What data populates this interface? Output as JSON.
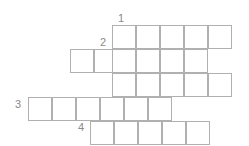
{
  "puzzle": {
    "type": "crossword-grid",
    "canvas": {
      "width": 249,
      "height": 146
    },
    "cell_size": 24,
    "colors": {
      "cell_border": "#b0b0b0",
      "cell_fill": "#ffffff",
      "clue_number": "#8a8a8a",
      "background": "#ffffff"
    },
    "clue_numbers": [
      {
        "label": "1",
        "x": 118,
        "y": 13
      },
      {
        "label": "2",
        "x": 100,
        "y": 37
      },
      {
        "label": "3",
        "x": 15,
        "y": 99
      },
      {
        "label": "4",
        "x": 78,
        "y": 122
      }
    ],
    "rows": [
      {
        "name": "row-1",
        "y": 25,
        "x_start": 112,
        "count": 5
      },
      {
        "name": "row-2",
        "y": 49,
        "x_start": 70,
        "count": 5
      },
      {
        "name": "row-3",
        "y": 73,
        "x_start": 112,
        "count": 5
      },
      {
        "name": "row-4",
        "y": 97,
        "x_start": 28,
        "count": 6
      },
      {
        "name": "row-5",
        "y": 121,
        "x_start": 90,
        "count": 5
      }
    ],
    "cells": [
      {
        "row": 1,
        "col": 1,
        "x": 112,
        "y": 25
      },
      {
        "row": 1,
        "col": 2,
        "x": 136,
        "y": 25
      },
      {
        "row": 1,
        "col": 3,
        "x": 160,
        "y": 25
      },
      {
        "row": 1,
        "col": 4,
        "x": 184,
        "y": 25
      },
      {
        "row": 1,
        "col": 5,
        "x": 208,
        "y": 25
      },
      {
        "row": 2,
        "col": 1,
        "x": 70,
        "y": 49
      },
      {
        "row": 2,
        "col": 2,
        "x": 94,
        "y": 49
      },
      {
        "row": 2,
        "col": 3,
        "x": 112,
        "y": 49
      },
      {
        "row": 2,
        "col": 4,
        "x": 136,
        "y": 49
      },
      {
        "row": 2,
        "col": 5,
        "x": 160,
        "y": 49
      },
      {
        "row": 2,
        "col": 6,
        "x": 184,
        "y": 49
      },
      {
        "row": 3,
        "col": 1,
        "x": 112,
        "y": 73
      },
      {
        "row": 3,
        "col": 2,
        "x": 136,
        "y": 73
      },
      {
        "row": 3,
        "col": 3,
        "x": 160,
        "y": 73
      },
      {
        "row": 3,
        "col": 4,
        "x": 184,
        "y": 73
      },
      {
        "row": 3,
        "col": 5,
        "x": 208,
        "y": 73
      },
      {
        "row": 4,
        "col": 1,
        "x": 28,
        "y": 97
      },
      {
        "row": 4,
        "col": 2,
        "x": 52,
        "y": 97
      },
      {
        "row": 4,
        "col": 3,
        "x": 76,
        "y": 97
      },
      {
        "row": 4,
        "col": 4,
        "x": 100,
        "y": 97
      },
      {
        "row": 4,
        "col": 5,
        "x": 124,
        "y": 97
      },
      {
        "row": 4,
        "col": 6,
        "x": 148,
        "y": 97
      },
      {
        "row": 5,
        "col": 1,
        "x": 90,
        "y": 121
      },
      {
        "row": 5,
        "col": 2,
        "x": 114,
        "y": 121
      },
      {
        "row": 5,
        "col": 3,
        "x": 138,
        "y": 121
      },
      {
        "row": 5,
        "col": 4,
        "x": 162,
        "y": 121
      },
      {
        "row": 5,
        "col": 5,
        "x": 186,
        "y": 121
      }
    ]
  }
}
